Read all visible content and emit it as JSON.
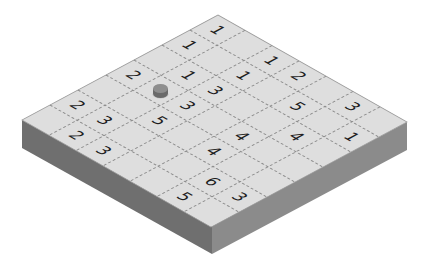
{
  "board": {
    "rows": 7,
    "cols": 7,
    "colors": {
      "top_surface": "#dedede",
      "left_face": "#6f6f6f",
      "right_face": "#8b8b8b",
      "edge": "#9a9a9a",
      "grid_lines": "#8a8a8a",
      "digits": "#1e1e1e",
      "token_top": "#8e8e8e",
      "token_side": "#6a6a6a"
    },
    "clues": [
      {
        "r": 0,
        "c": 0,
        "value": "1"
      },
      {
        "r": 0,
        "c": 2,
        "value": "1"
      },
      {
        "r": 0,
        "c": 3,
        "value": "2"
      },
      {
        "r": 0,
        "c": 5,
        "value": "3"
      },
      {
        "r": 1,
        "c": 0,
        "value": "1"
      },
      {
        "r": 1,
        "c": 2,
        "value": "1"
      },
      {
        "r": 1,
        "c": 4,
        "value": "5"
      },
      {
        "r": 1,
        "c": 6,
        "value": "1"
      },
      {
        "r": 2,
        "c": 1,
        "value": "1"
      },
      {
        "r": 2,
        "c": 2,
        "value": "3"
      },
      {
        "r": 2,
        "c": 5,
        "value": "4"
      },
      {
        "r": 3,
        "c": 0,
        "value": "2"
      },
      {
        "r": 3,
        "c": 2,
        "value": "3"
      },
      {
        "r": 3,
        "c": 4,
        "value": "4"
      },
      {
        "r": 4,
        "c": 2,
        "value": "5"
      },
      {
        "r": 4,
        "c": 4,
        "value": "4"
      },
      {
        "r": 5,
        "c": 0,
        "value": "2"
      },
      {
        "r": 5,
        "c": 1,
        "value": "3"
      },
      {
        "r": 5,
        "c": 5,
        "value": "6"
      },
      {
        "r": 5,
        "c": 6,
        "value": "3"
      },
      {
        "r": 6,
        "c": 1,
        "value": "2"
      },
      {
        "r": 6,
        "c": 2,
        "value": "3"
      },
      {
        "r": 6,
        "c": 5,
        "value": "5"
      }
    ],
    "token": {
      "r": 3,
      "c": 1,
      "icon": "cylinder-token-icon"
    }
  }
}
